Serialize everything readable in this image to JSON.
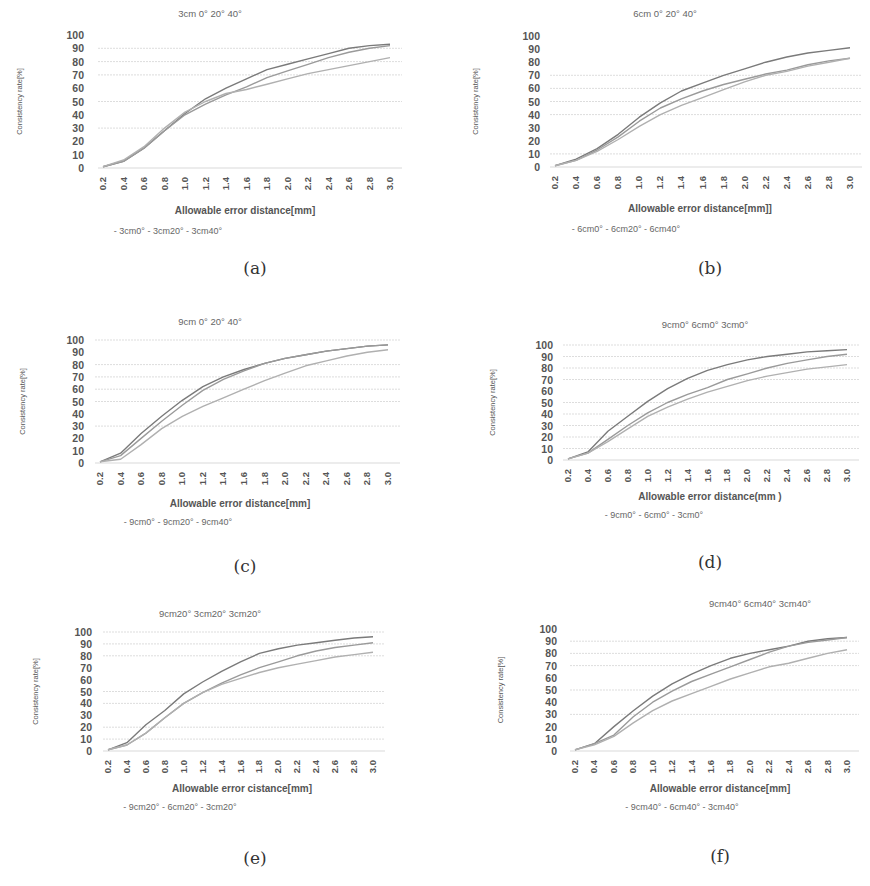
{
  "figure": {
    "panel_labels": [
      "(a)",
      "(b)",
      "(c)",
      "(d)",
      "(e)",
      "(f)"
    ],
    "y_axis_label": "Consistency rate[%]",
    "line_color": "#8a8a8a",
    "grid_color": "#d9d9d9"
  },
  "chart_data": [
    {
      "type": "line",
      "panel": "(a)",
      "title": "3cm   0°   20°   40°",
      "xlabel": "Allowable error distance[mm]",
      "ylabel": "Consistency rate[%]",
      "x": [
        0.2,
        0.4,
        0.6,
        0.8,
        1.0,
        1.2,
        1.4,
        1.6,
        1.8,
        2.0,
        2.2,
        2.4,
        2.6,
        2.8,
        3.0
      ],
      "x_tick_labels": [
        "0.2",
        "0.4",
        "0.6",
        "0.8",
        "1.0",
        "1.2",
        "1.4",
        "1.6",
        "1.8",
        "2.0",
        "2.2",
        "2.4",
        "2.6",
        "2.8",
        "3.0"
      ],
      "y_ticks": [
        0,
        10,
        20,
        30,
        40,
        50,
        60,
        70,
        80,
        90,
        100
      ],
      "ylim": [
        0,
        100
      ],
      "gridlines": [
        90,
        80,
        70,
        50,
        30,
        0
      ],
      "series": [
        {
          "name": "3cm0°",
          "values": [
            1,
            5,
            15,
            28,
            41,
            52,
            60,
            67,
            74,
            78,
            82,
            86,
            90,
            92,
            93
          ]
        },
        {
          "name": "3cm20°",
          "values": [
            1,
            5,
            15,
            28,
            40,
            48,
            55,
            61,
            68,
            73,
            78,
            83,
            87,
            90,
            92
          ]
        },
        {
          "name": "3cm40°",
          "values": [
            1,
            6,
            16,
            30,
            42,
            50,
            56,
            59,
            63,
            67,
            71,
            74,
            77,
            80,
            83
          ]
        }
      ],
      "legend": [
        "- 3cm0°",
        "- 3cm20°",
        "- 3cm40°"
      ]
    },
    {
      "type": "line",
      "panel": "(b)",
      "title": "6cm   0°   20°   40°",
      "xlabel": "Allowable error distance[mm]]",
      "ylabel": "Consistency rate[%]",
      "x": [
        0.2,
        0.4,
        0.6,
        0.8,
        1.0,
        1.2,
        1.4,
        1.6,
        1.8,
        2.0,
        2.2,
        2.4,
        2.6,
        2.8,
        3.0
      ],
      "x_tick_labels": [
        "0.2",
        "0.4",
        "0.6",
        "0.8",
        "1.0",
        "1.2",
        "1.4",
        "1.6",
        "1.8",
        "2.0",
        "2.2",
        "2.4",
        "2.6",
        "2.8",
        "3.0"
      ],
      "y_ticks": [
        0,
        10,
        20,
        30,
        40,
        50,
        60,
        70,
        80,
        90,
        100
      ],
      "ylim": [
        0,
        100
      ],
      "gridlines": [
        70,
        60,
        50,
        40,
        10,
        0
      ],
      "series": [
        {
          "name": "6cm0°",
          "values": [
            1,
            6,
            14,
            25,
            38,
            49,
            58,
            64,
            70,
            75,
            80,
            84,
            87,
            89,
            91
          ]
        },
        {
          "name": "6cm20°",
          "values": [
            1,
            5,
            13,
            23,
            35,
            45,
            52,
            58,
            63,
            67,
            71,
            74,
            78,
            81,
            83
          ]
        },
        {
          "name": "6cm40°",
          "values": [
            1,
            5,
            12,
            21,
            31,
            40,
            47,
            53,
            59,
            65,
            70,
            73,
            77,
            80,
            83
          ]
        }
      ],
      "legend": [
        "- 6cm0°",
        "- 6cm20°",
        "- 6cm40°"
      ]
    },
    {
      "type": "line",
      "panel": "(c)",
      "title": "9cm   0°   20°   40°",
      "xlabel": "Allowable error distance[mm]",
      "ylabel": "Consistency rate[%]",
      "x": [
        0.2,
        0.4,
        0.6,
        0.8,
        1.0,
        1.2,
        1.4,
        1.6,
        1.8,
        2.0,
        2.2,
        2.4,
        2.6,
        2.8,
        3.0
      ],
      "x_tick_labels": [
        "0.2",
        "0.4",
        "0.6",
        "0.8",
        "1.0",
        "1.2",
        "1.4",
        "1.6",
        "1.8",
        "2.0",
        "2.2",
        "2.4",
        "2.6",
        "2.8",
        "3.0"
      ],
      "y_ticks": [
        0,
        10,
        20,
        30,
        40,
        50,
        60,
        70,
        80,
        90,
        100
      ],
      "ylim": [
        0,
        100
      ],
      "gridlines": [
        100,
        80,
        70,
        60,
        50,
        30,
        0
      ],
      "series": [
        {
          "name": "9cm0°",
          "values": [
            1,
            8,
            24,
            38,
            51,
            62,
            70,
            76,
            81,
            85,
            88,
            91,
            93,
            95,
            96
          ]
        },
        {
          "name": "9cm20°",
          "values": [
            1,
            6,
            20,
            34,
            47,
            59,
            68,
            75,
            81,
            85,
            88,
            91,
            93,
            95,
            96
          ]
        },
        {
          "name": "9cm40°",
          "values": [
            1,
            3,
            15,
            28,
            38,
            46,
            53,
            60,
            67,
            73,
            79,
            83,
            87,
            90,
            92
          ]
        }
      ],
      "legend": [
        "- 9cm0°",
        "- 9cm20°",
        "- 9cm40°"
      ]
    },
    {
      "type": "line",
      "panel": "(d)",
      "title": "9cm0°  6cm0°  3cm0°",
      "xlabel": "Allowable error distance(mm )",
      "ylabel": "Consistency rate[%]",
      "x": [
        0.2,
        0.4,
        0.6,
        0.8,
        1.0,
        1.2,
        1.4,
        1.6,
        1.8,
        2.0,
        2.2,
        2.4,
        2.6,
        2.8,
        3.0
      ],
      "x_tick_labels": [
        "0.2",
        "0.4",
        "0.6",
        "0.8",
        "1.0",
        "1.2",
        "1.4",
        "1.6",
        "1.8",
        "2.0",
        "2.2",
        "2.4",
        "2.6",
        "2.8",
        "3.0"
      ],
      "y_ticks": [
        0,
        10,
        20,
        30,
        40,
        50,
        60,
        70,
        80,
        90,
        100
      ],
      "ylim": [
        0,
        100
      ],
      "gridlines": [
        100,
        90,
        80,
        70,
        50,
        40,
        30,
        20,
        10,
        0
      ],
      "series": [
        {
          "name": "9cm0°",
          "values": [
            1,
            7,
            25,
            38,
            51,
            62,
            71,
            78,
            83,
            87,
            90,
            92,
            94,
            95,
            96
          ]
        },
        {
          "name": "6cm0°",
          "values": [
            1,
            6,
            18,
            30,
            41,
            50,
            57,
            63,
            70,
            75,
            80,
            84,
            87,
            90,
            92
          ]
        },
        {
          "name": "3cm0°",
          "values": [
            1,
            6,
            16,
            27,
            38,
            46,
            53,
            59,
            64,
            69,
            73,
            76,
            79,
            81,
            83
          ]
        }
      ],
      "legend": [
        "- 9cm0°",
        "- 6cm0°",
        "- 3cm0°"
      ]
    },
    {
      "type": "line",
      "panel": "(e)",
      "title": "9cm20°  3cm20°   3cm20°",
      "xlabel": "Allowable error cistance[mm]",
      "ylabel": "Consistency rate[%]",
      "x": [
        0.2,
        0.4,
        0.6,
        0.8,
        1.0,
        1.2,
        1.4,
        1.6,
        1.8,
        2.0,
        2.2,
        2.4,
        2.6,
        2.8,
        3.0
      ],
      "x_tick_labels": [
        "0.2",
        "0.4",
        "0.6",
        "0.8",
        "1.0",
        "1.2",
        "1.4",
        "1.6",
        "1.8",
        "2.0",
        "2.2",
        "2.4",
        "2.6",
        "2.8",
        "3.0"
      ],
      "y_ticks": [
        0,
        10,
        20,
        30,
        40,
        50,
        60,
        70,
        80,
        90,
        100
      ],
      "ylim": [
        0,
        100
      ],
      "gridlines": [
        100,
        90,
        80,
        50,
        40,
        20,
        10,
        0
      ],
      "series": [
        {
          "name": "9cm20°",
          "values": [
            1,
            7,
            22,
            34,
            48,
            58,
            67,
            75,
            82,
            86,
            89,
            91,
            93,
            95,
            96
          ]
        },
        {
          "name": "6cm20°",
          "values": [
            1,
            5,
            15,
            28,
            40,
            49,
            57,
            64,
            70,
            75,
            80,
            84,
            87,
            89,
            91
          ]
        },
        {
          "name": "3cm20°",
          "values": [
            1,
            5,
            15,
            28,
            40,
            49,
            56,
            61,
            66,
            70,
            73,
            76,
            79,
            81,
            83
          ]
        }
      ],
      "legend": [
        "- 9cm20°",
        "- 6cm20°",
        "- 3cm20°"
      ]
    },
    {
      "type": "line",
      "panel": "(f)",
      "title": "9cm40°  6cm40°  3cm40°",
      "xlabel": "Allowable error distance[mm]",
      "ylabel": "Consistency rate[%]",
      "x": [
        0.2,
        0.4,
        0.6,
        0.8,
        1.0,
        1.2,
        1.4,
        1.6,
        1.8,
        2.0,
        2.2,
        2.4,
        2.6,
        2.8,
        3.0
      ],
      "x_tick_labels": [
        "0.2",
        "0.4",
        "0.6",
        "0.8",
        "1.0",
        "1.2",
        "1.4",
        "1.6",
        "1.8",
        "2.0",
        "2.2",
        "2.4",
        "2.6",
        "2.8",
        "3.0"
      ],
      "y_ticks": [
        0,
        10,
        20,
        30,
        40,
        50,
        60,
        70,
        80,
        90,
        100
      ],
      "ylim": [
        0,
        100
      ],
      "gridlines": [
        90,
        80,
        70,
        50,
        30,
        0
      ],
      "series": [
        {
          "name": "9cm40°",
          "values": [
            1,
            6,
            20,
            33,
            45,
            55,
            63,
            70,
            76,
            80,
            83,
            86,
            90,
            92,
            93
          ]
        },
        {
          "name": "6cm40°",
          "values": [
            1,
            6,
            13,
            28,
            40,
            49,
            57,
            63,
            69,
            75,
            81,
            86,
            89,
            91,
            93
          ]
        },
        {
          "name": "3cm40°",
          "values": [
            1,
            5,
            12,
            23,
            33,
            41,
            47,
            53,
            59,
            64,
            69,
            72,
            76,
            80,
            83
          ]
        }
      ],
      "legend": [
        "- 9cm40°",
        "- 6cm40°",
        "- 3cm40°"
      ]
    }
  ]
}
